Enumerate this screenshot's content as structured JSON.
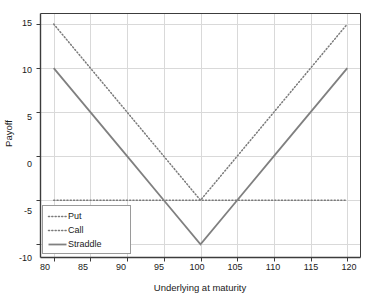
{
  "chart_data": {
    "type": "line",
    "title": "",
    "subtitle": "",
    "xlabel": "Underlying at maturity",
    "ylabel": "Payoff",
    "xlim": [
      78.2,
      121.8
    ],
    "ylim": [
      -11.5,
      16.2
    ],
    "xticks": [
      80,
      85,
      90,
      95,
      100,
      105,
      110,
      115,
      120
    ],
    "xtick_labels": [
      "80",
      "85",
      "90",
      "95",
      "100",
      "105",
      "110",
      "115",
      "120"
    ],
    "yticks": [
      15,
      10,
      5,
      0,
      -5,
      -10
    ],
    "ytick_labels": [
      "15",
      "10",
      "5",
      "0",
      "-5",
      "-10"
    ],
    "grid": true,
    "grid_color": "#d9d9d9",
    "axis_color": "#3c3c3c",
    "legend_position": "bottom-left",
    "annotations": [],
    "series": [
      {
        "name": "Put",
        "style": "dotted",
        "color": "#7a7a7a",
        "x": [
          80,
          85,
          90,
          95,
          100,
          105,
          110,
          115,
          120
        ],
        "values": [
          15,
          10,
          5,
          0,
          -5,
          -5,
          -5,
          -5,
          -5
        ]
      },
      {
        "name": "Call",
        "style": "dotted",
        "color": "#7a7a7a",
        "x": [
          80,
          85,
          90,
          95,
          100,
          105,
          110,
          115,
          120
        ],
        "values": [
          -5,
          -5,
          -5,
          -5,
          -5,
          0,
          5,
          10,
          15
        ]
      },
      {
        "name": "Straddle",
        "style": "solid",
        "color": "#808080",
        "x": [
          80,
          85,
          90,
          95,
          100,
          105,
          110,
          115,
          120
        ],
        "values": [
          10,
          5,
          0,
          -5,
          -10,
          -5,
          0,
          5,
          10
        ]
      }
    ]
  },
  "legend": {
    "items": [
      {
        "label": "Put"
      },
      {
        "label": "Call"
      },
      {
        "label": "Straddle"
      }
    ]
  },
  "axes": {
    "y_label": "Payoff",
    "x_label": "Underlying at maturity",
    "ytick_0": "15",
    "ytick_1": "10",
    "ytick_2": "5",
    "ytick_3": "0",
    "ytick_4": "-5",
    "ytick_5": "-10",
    "xtick_0": "80",
    "xtick_1": "85",
    "xtick_2": "90",
    "xtick_3": "95",
    "xtick_4": "100",
    "xtick_5": "105",
    "xtick_6": "110",
    "xtick_7": "115",
    "xtick_8": "120"
  }
}
